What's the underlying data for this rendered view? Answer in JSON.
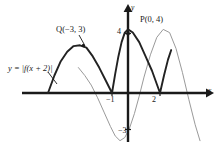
{
  "figure": {
    "axes": {
      "x_axis_label": "x",
      "y_axis_label": "y",
      "x_ticks": [
        {
          "label": "−1",
          "value": -1
        },
        {
          "label": "2",
          "value": 2
        }
      ],
      "y_ticks": [
        {
          "label": "4",
          "value": 4
        },
        {
          "label": "−3",
          "value": -3
        }
      ]
    },
    "annotations": {
      "equation_label": "y = |f(x + 2)|",
      "point_q_label": "Q(−3, 3)",
      "point_p_label": "P(0, 4)"
    },
    "colors": {
      "axis": "#1a1a1a",
      "transformed_curve": "#222222",
      "original_curve": "#9a9a9a",
      "text": "#1a1a1a",
      "background": "#ffffff"
    }
  },
  "chart_data": {
    "type": "line",
    "title": "y = |f(x + 2)|",
    "xlabel": "x",
    "ylabel": "y",
    "xlim": [
      -6,
      5.6
    ],
    "ylim": [
      -4.2,
      5
    ],
    "grid": false,
    "legend": null,
    "labeled_points": [
      {
        "name": "Q",
        "label": "Q(−3, 3)",
        "x": -3,
        "y": 3,
        "series": "transformed_curve"
      },
      {
        "name": "P",
        "label": "P(0, 4)",
        "x": 0,
        "y": 4,
        "series": "transformed_curve"
      }
    ],
    "series": [
      {
        "name": "transformed_curve",
        "label": "y = |f(x + 2)|",
        "color": "#222222",
        "width": 1.9,
        "note": "Absolute value of f shifted 2 left; cusps on x-axis at x = -5, -1, 2; local max 3 at x = -3; max 4 at x = 0; truncated rising branch after x = 2",
        "points": [
          {
            "x": -5.0,
            "y": 0.0
          },
          {
            "x": -4.6,
            "y": 1.1
          },
          {
            "x": -4.2,
            "y": 2.0
          },
          {
            "x": -3.8,
            "y": 2.6
          },
          {
            "x": -3.4,
            "y": 2.95
          },
          {
            "x": -3.0,
            "y": 3.0
          },
          {
            "x": -2.6,
            "y": 2.85
          },
          {
            "x": -2.2,
            "y": 2.3
          },
          {
            "x": -1.8,
            "y": 1.6
          },
          {
            "x": -1.4,
            "y": 0.8
          },
          {
            "x": -1.0,
            "y": 0.0
          },
          {
            "x": -0.8,
            "y": 1.2
          },
          {
            "x": -0.6,
            "y": 2.3
          },
          {
            "x": -0.4,
            "y": 3.2
          },
          {
            "x": -0.2,
            "y": 3.8
          },
          {
            "x": 0.0,
            "y": 4.0
          },
          {
            "x": 0.3,
            "y": 3.8
          },
          {
            "x": 0.7,
            "y": 3.2
          },
          {
            "x": 1.1,
            "y": 2.3
          },
          {
            "x": 1.5,
            "y": 1.4
          },
          {
            "x": 2.0,
            "y": 0.0
          },
          {
            "x": 2.25,
            "y": 1.1
          },
          {
            "x": 2.5,
            "y": 2.1
          },
          {
            "x": 2.7,
            "y": 2.7
          }
        ]
      },
      {
        "name": "original_curve",
        "label": "y = f(x)",
        "color": "#9a9a9a",
        "width": 1.0,
        "note": "Original wave: descends from about 2 at x = -2.6, crosses zero near x = -1.6, minimum -3 near x = -0.5, crosses zero near x = 0.5, maximum 4 near x = 2.2, crosses zero near x = 3.4, falls to about -3 at x = 4.4",
        "points": [
          {
            "x": -3.1,
            "y": 1.6
          },
          {
            "x": -2.7,
            "y": 1.1
          },
          {
            "x": -2.3,
            "y": 0.5
          },
          {
            "x": -1.9,
            "y": -0.3
          },
          {
            "x": -1.5,
            "y": -1.2
          },
          {
            "x": -1.1,
            "y": -2.1
          },
          {
            "x": -0.8,
            "y": -2.7
          },
          {
            "x": -0.5,
            "y": -3.0
          },
          {
            "x": -0.2,
            "y": -2.8
          },
          {
            "x": 0.1,
            "y": -2.2
          },
          {
            "x": 0.4,
            "y": -1.3
          },
          {
            "x": 0.7,
            "y": -0.2
          },
          {
            "x": 1.0,
            "y": 1.0
          },
          {
            "x": 1.4,
            "y": 2.4
          },
          {
            "x": 1.8,
            "y": 3.5
          },
          {
            "x": 2.2,
            "y": 4.0
          },
          {
            "x": 2.6,
            "y": 3.8
          },
          {
            "x": 3.0,
            "y": 2.8
          },
          {
            "x": 3.4,
            "y": 1.3
          },
          {
            "x": 3.8,
            "y": -0.4
          },
          {
            "x": 4.2,
            "y": -2.0
          },
          {
            "x": 4.5,
            "y": -3.0
          }
        ]
      }
    ]
  }
}
